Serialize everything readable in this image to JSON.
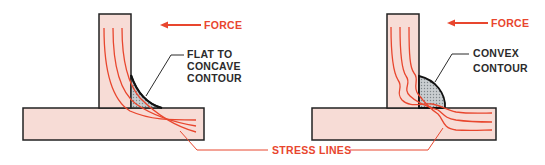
{
  "colors": {
    "plate_fill": "#f7dcd6",
    "outline": "#222222",
    "stress_line": "#e8462e",
    "label_red": "#e8462e",
    "label_dark": "#2b2b2b",
    "weld_fill": "#bfc3c6"
  },
  "left_figure": {
    "force_label": "FORCE",
    "contour_label_lines": [
      "FLAT TO",
      "CONCAVE",
      "CONTOUR"
    ]
  },
  "right_figure": {
    "force_label": "FORCE",
    "contour_label_lines": [
      "CONVEX",
      "CONTOUR"
    ]
  },
  "shared": {
    "stress_lines_label": "STRESS LINES"
  },
  "icons": {
    "force_arrow": "arrow-left-icon"
  }
}
